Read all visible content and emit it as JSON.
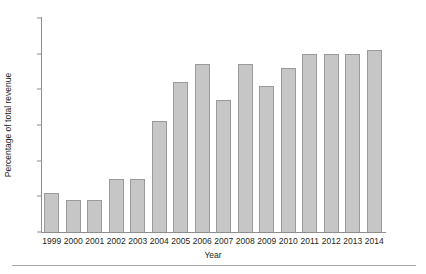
{
  "chart_data": {
    "type": "bar",
    "title": "",
    "subtitle": "",
    "xlabel": "Year",
    "ylabel": "Percentage of total revenue",
    "categories": [
      "1999",
      "2000",
      "2001",
      "2002",
      "2003",
      "2004",
      "2005",
      "2006",
      "2007",
      "2008",
      "2009",
      "2010",
      "2011",
      "2012",
      "2013",
      "2014"
    ],
    "values": [
      11,
      9,
      9,
      15,
      15,
      31,
      42,
      47,
      37,
      47,
      41,
      46,
      50,
      50,
      50,
      51
    ],
    "series": [
      {
        "name": "Percentage of total revenue",
        "values": [
          11,
          9,
          9,
          15,
          15,
          31,
          42,
          47,
          37,
          47,
          41,
          46,
          50,
          50,
          50,
          51
        ]
      }
    ],
    "ylim": [
      0,
      60
    ],
    "yticks": [
      0,
      10,
      20,
      30,
      40,
      50,
      60
    ],
    "ytick_labels": [
      "0",
      "10",
      "20",
      "30",
      "40",
      "50",
      "60"
    ],
    "xtick_labels": [
      "1999",
      "2000",
      "2001",
      "2002",
      "2003",
      "2004",
      "2005",
      "2006",
      "2007",
      "2008",
      "2009",
      "2010",
      "2011",
      "2012",
      "2013",
      "2014"
    ],
    "grid": false,
    "legend": false,
    "legend_position": "none",
    "bar_color": "#c6c6c6",
    "bar_edge_color": "#9a9a9a",
    "axis_color": "#8d8d8d",
    "text_color": "#231f20",
    "background_color": "#ffffff",
    "annotations": []
  },
  "figure": {
    "footer_rule_color": "#a8a8a8"
  }
}
